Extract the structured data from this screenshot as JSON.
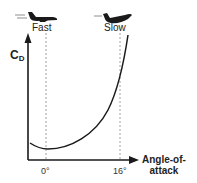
{
  "diagram": {
    "type": "drag-coefficient-vs-angle-of-attack",
    "y_axis_label": "C",
    "y_axis_subscript": "D",
    "x_axis_label_line1": "Angle-of-",
    "x_axis_label_line2": "attack",
    "ticks": [
      {
        "label": "0°",
        "value": 0
      },
      {
        "label": "16°",
        "value": 16
      }
    ],
    "markers": [
      {
        "label": "Fast",
        "icon": "airplane-level-icon"
      },
      {
        "label": "Slow",
        "icon": "airplane-nose-up-icon"
      }
    ],
    "curve_description": "Drag coefficient rises parabolically with angle of attack; minimum near 0°, steep rise toward 16°",
    "colors": {
      "line": "#1a1a1a",
      "guide": "#888888"
    }
  }
}
